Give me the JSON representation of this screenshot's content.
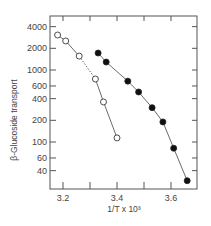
{
  "chart_data": {
    "type": "scatter",
    "title": "",
    "xlabel": "1/T x 10³",
    "ylabel": "β-Glucoside transport",
    "xlim": [
      3.15,
      3.7
    ],
    "ylim": [
      25,
      5000
    ],
    "yscale": "log",
    "grid": false,
    "legend": null,
    "x_ticks": [
      3.2,
      3.3,
      3.4,
      3.5,
      3.6
    ],
    "x_tick_labels": [
      "3.2",
      "",
      "3.4",
      "",
      "3.6"
    ],
    "y_ticks": [
      4000,
      2000,
      1000,
      600,
      400,
      200,
      100,
      60,
      40
    ],
    "y_tick_labels": [
      "4000",
      "2000",
      "1000",
      "600",
      "400",
      "200",
      "100",
      "60",
      "40"
    ],
    "series": [
      {
        "name": "open circles",
        "marker": "open-circle",
        "line": "solid with dashed segment between 3rd and 4th points",
        "x": [
          3.18,
          3.21,
          3.26,
          3.32,
          3.35,
          3.4
        ],
        "y": [
          3060,
          2530,
          1560,
          750,
          360,
          114
        ]
      },
      {
        "name": "filled circles",
        "marker": "filled-circle",
        "line": "solid",
        "x": [
          3.33,
          3.36,
          3.44,
          3.48,
          3.53,
          3.57,
          3.61,
          3.66
        ],
        "y": [
          1720,
          1290,
          700,
          495,
          300,
          190,
          82,
          29
        ]
      }
    ]
  }
}
